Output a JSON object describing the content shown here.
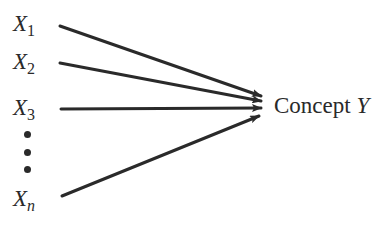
{
  "diagram": {
    "inputs": [
      {
        "base": "X",
        "sub": "1",
        "sub_italic": false
      },
      {
        "base": "X",
        "sub": "2",
        "sub_italic": false
      },
      {
        "base": "X",
        "sub": "3",
        "sub_italic": false
      },
      {
        "base": "X",
        "sub": "n",
        "sub_italic": true
      }
    ],
    "ellipsis": "vertical-dots",
    "target": {
      "label": "Concept",
      "variable": "Y"
    },
    "arrows": [
      {
        "from": "X1",
        "to": "Concept Y"
      },
      {
        "from": "X2",
        "to": "Concept Y"
      },
      {
        "from": "X3",
        "to": "Concept Y"
      },
      {
        "from": "Xn",
        "to": "Concept Y"
      }
    ],
    "colors": {
      "ink": "#2a2a2a",
      "background": "#ffffff"
    }
  }
}
